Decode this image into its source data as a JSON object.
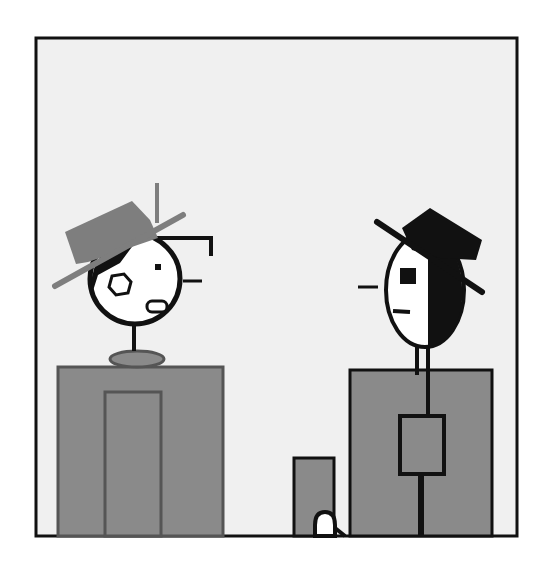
{
  "figure": {
    "description": "Cartoon panel: two stylized figures facing each other above gray block bodies",
    "colors": {
      "page": "#ffffff",
      "panel_bg": "#f0f0f0",
      "outline": "#111111",
      "gray_fill": "#8a8a8a",
      "hat_gray": "#7e7e7e",
      "face": "#ffffff",
      "black": "#111111"
    },
    "left_figure": {
      "label": "Figure with gray tilted hat, round face, eye patch",
      "hat": "gray-hat",
      "body": "gray-block-with-door"
    },
    "right_figure": {
      "label": "Figure with black top hat, half-shaded oval face",
      "hat": "black-hat",
      "body": "gray-block-with-square-buckle"
    },
    "center_object": {
      "label": "Small gray block with a white arched opening"
    }
  }
}
